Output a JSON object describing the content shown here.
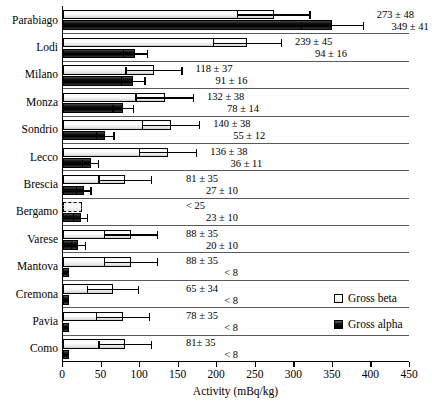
{
  "chart_data": {
    "type": "bar",
    "orientation": "horizontal",
    "title": "",
    "xlabel": "Activity (mBq/kg)",
    "ylabel": "",
    "xlim": [
      0,
      450
    ],
    "xticks": [
      0,
      50,
      100,
      150,
      200,
      250,
      300,
      350,
      400,
      450
    ],
    "grid": false,
    "legend_position": "right-middle",
    "categories": [
      "Parabiago",
      "Lodi",
      "Milano",
      "Monza",
      "Sondrio",
      "Lecco",
      "Brescia",
      "Bergamo",
      "Varese",
      "Mantova",
      "Cremona",
      "Pavia",
      "Como"
    ],
    "series": [
      {
        "name": "Gross beta",
        "values": [
          273,
          239,
          118,
          132,
          140,
          136,
          81,
          25,
          88,
          88,
          65,
          78,
          81
        ],
        "errors": [
          48,
          45,
          37,
          38,
          38,
          38,
          35,
          0,
          35,
          35,
          34,
          35,
          35
        ],
        "censored": [
          false,
          false,
          false,
          false,
          false,
          false,
          false,
          true,
          false,
          false,
          false,
          false,
          false
        ],
        "labels": [
          "273 ± 48",
          "239 ± 45",
          "118 ± 37",
          "132 ± 38",
          "140 ± 38",
          "136 ± 38",
          "81 ± 35",
          "< 25",
          "88 ± 35",
          "88 ± 35",
          "65 ± 34",
          "78 ± 35",
          "81± 35"
        ]
      },
      {
        "name": "Gross alpha",
        "values": [
          349,
          94,
          91,
          78,
          55,
          36,
          27,
          23,
          20,
          8,
          8,
          8,
          8
        ],
        "errors": [
          41,
          16,
          16,
          14,
          12,
          11,
          10,
          10,
          10,
          0,
          0,
          0,
          0
        ],
        "censored": [
          false,
          false,
          false,
          false,
          false,
          false,
          false,
          false,
          false,
          true,
          true,
          true,
          true
        ],
        "labels": [
          "349 ± 41",
          "94 ± 16",
          "91 ± 16",
          "78 ± 14",
          "55 ± 12",
          "36 ± 11",
          "27 ± 10",
          "23 ± 10",
          "20 ± 10",
          "< 8",
          "< 8",
          "< 8",
          "< 8"
        ]
      }
    ]
  },
  "axis": {
    "x_title": "Activity (mBq/kg)",
    "tick_labels": [
      "0",
      "50",
      "100",
      "150",
      "200",
      "250",
      "300",
      "350",
      "400",
      "450"
    ]
  },
  "legend": {
    "beta_label": "Gross beta",
    "alpha_label": "Gross alpha"
  },
  "colors": {
    "beta_fill": "#ffffff",
    "alpha_fill": "#000000",
    "axis": "#000000",
    "text": "#000000"
  }
}
